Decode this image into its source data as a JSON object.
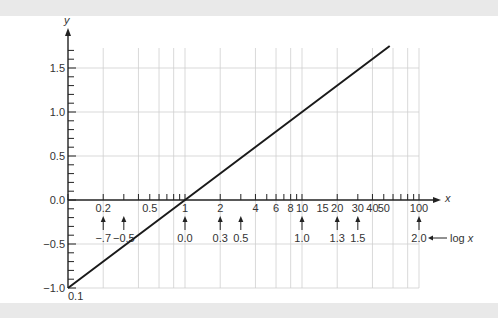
{
  "chart_data": {
    "type": "line",
    "title": "",
    "xlabel": "x",
    "ylabel": "y",
    "x_scale": "log",
    "x_secondary_label": "log x",
    "xlim": [
      0.1,
      100
    ],
    "ylim": [
      -1.0,
      1.75
    ],
    "grid": true,
    "series": [
      {
        "name": "y = log x",
        "x": [
          0.1,
          1,
          10,
          56.2
        ],
        "y": [
          -1.0,
          0.0,
          1.0,
          1.75
        ]
      }
    ],
    "y_ticks": [
      {
        "value": 1.5,
        "label": "1.5"
      },
      {
        "value": 1.0,
        "label": "1.0"
      },
      {
        "value": 0.5,
        "label": "0.5"
      },
      {
        "value": 0.0,
        "label": "0.0"
      },
      {
        "value": -0.5,
        "label": "−0.5"
      },
      {
        "value": -1.0,
        "label": "−1.0"
      }
    ],
    "x_tick_labels": [
      {
        "value": 0.1,
        "label": "0.1"
      },
      {
        "value": 0.2,
        "label": "0.2"
      },
      {
        "value": 0.5,
        "label": "0.5"
      },
      {
        "value": 1,
        "label": "1"
      },
      {
        "value": 2,
        "label": "2"
      },
      {
        "value": 4,
        "label": "4"
      },
      {
        "value": 6,
        "label": "6"
      },
      {
        "value": 8,
        "label": "8"
      },
      {
        "value": 10,
        "label": "10"
      },
      {
        "value": 15,
        "label": "15"
      },
      {
        "value": 20,
        "label": "20"
      },
      {
        "value": 30,
        "label": "30"
      },
      {
        "value": 40,
        "label": "40"
      },
      {
        "value": 50,
        "label": "50"
      },
      {
        "value": 100,
        "label": "100"
      }
    ],
    "log_annotations": [
      {
        "x": 0.2,
        "label": "−.7"
      },
      {
        "x": 0.3,
        "label": "−0.5"
      },
      {
        "x": 1,
        "label": "0.0"
      },
      {
        "x": 2,
        "label": "0.3"
      },
      {
        "x": 3,
        "label": "0.5"
      },
      {
        "x": 10,
        "label": "1.0"
      },
      {
        "x": 20,
        "label": "1.3"
      },
      {
        "x": 30,
        "label": "1.5"
      },
      {
        "x": 100,
        "label": "2.0"
      }
    ],
    "vertical_gridlines": [
      0.2,
      0.4,
      0.6,
      0.8,
      1,
      2,
      4,
      6,
      8,
      10,
      20,
      40,
      60,
      80,
      100
    ],
    "horizontal_gridlines": [
      1.5,
      1.0,
      0.5,
      -0.5,
      -1.0
    ]
  },
  "labels": {
    "x_axis": "x",
    "y_axis": "y",
    "log_x": "log x",
    "origin": "0.1"
  }
}
